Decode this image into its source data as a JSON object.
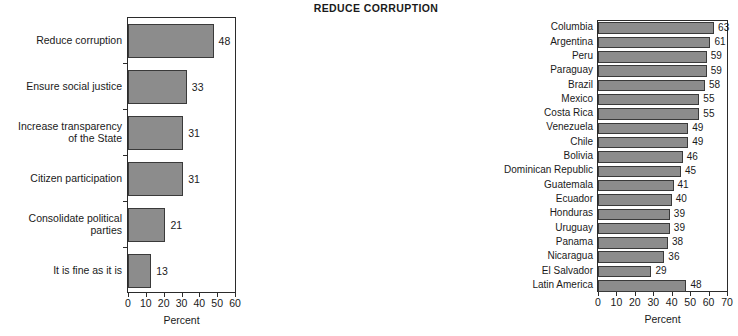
{
  "chart_data": [
    {
      "id": "left",
      "type": "bar",
      "orientation": "horizontal",
      "title": "",
      "xlabel": "Percent",
      "ylabel": "",
      "xlim": [
        0,
        60
      ],
      "xticks": [
        0,
        10,
        20,
        30,
        40,
        50,
        60
      ],
      "grid": false,
      "legend": "none",
      "bar_color": "#8c8c8c",
      "categories": [
        "Reduce corruption",
        "Ensure social justice",
        "Increase transparency of the State",
        "Citizen participation",
        "Consolidate political parties",
        "It is fine as it is"
      ],
      "category_lines": [
        [
          "Reduce corruption"
        ],
        [
          "Ensure social justice"
        ],
        [
          "Increase transparency",
          "of the State"
        ],
        [
          "Citizen participation"
        ],
        [
          "Consolidate political",
          "parties"
        ],
        [
          "It is fine as it is"
        ]
      ],
      "values": [
        48,
        33,
        31,
        31,
        21,
        13
      ],
      "value_labels": [
        "48",
        "33",
        "31",
        "31",
        "21",
        "13"
      ]
    },
    {
      "id": "right",
      "type": "bar",
      "orientation": "horizontal",
      "title": "REDUCE CORRUPTION",
      "xlabel": "Percent",
      "ylabel": "",
      "xlim": [
        0,
        70
      ],
      "xticks": [
        0,
        10,
        20,
        30,
        40,
        50,
        60,
        70
      ],
      "grid": false,
      "legend": "none",
      "bar_color": "#8c8c8c",
      "categories": [
        "Columbia",
        "Argentina",
        "Peru",
        "Paraguay",
        "Brazil",
        "Mexico",
        "Costa Rica",
        "Venezuela",
        "Chile",
        "Bolivia",
        "Dominican Republic",
        "Guatemala",
        "Ecuador",
        "Honduras",
        "Uruguay",
        "Panama",
        "Nicaragua",
        "El Salvador",
        "Latin America"
      ],
      "values": [
        63,
        61,
        59,
        59,
        58,
        55,
        55,
        49,
        49,
        46,
        45,
        41,
        40,
        39,
        39,
        38,
        36,
        29,
        48
      ],
      "value_labels": [
        "63",
        "61",
        "59",
        "59",
        "58",
        "55",
        "55",
        "49",
        "49",
        "46",
        "45",
        "41",
        "40",
        "39",
        "39",
        "38",
        "36",
        "29",
        "48"
      ]
    }
  ]
}
